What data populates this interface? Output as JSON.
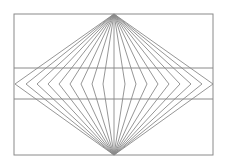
{
  "figure": {
    "stroke_color": "#8a8a8a",
    "frame": {
      "x": 14,
      "y": 14,
      "width": 199,
      "height": 141
    },
    "top_apex": {
      "x": 114,
      "y": 14
    },
    "bottom_apex": {
      "x": 114,
      "y": 155
    },
    "vertex_y": 84,
    "horizontal_lines_y": [
      68,
      99
    ],
    "vertex_offsets": [
      -99,
      -88,
      -77,
      -66,
      -55,
      -44,
      -33,
      -22,
      -11,
      0,
      11,
      22,
      33,
      44,
      55,
      66,
      77,
      88,
      99
    ]
  }
}
